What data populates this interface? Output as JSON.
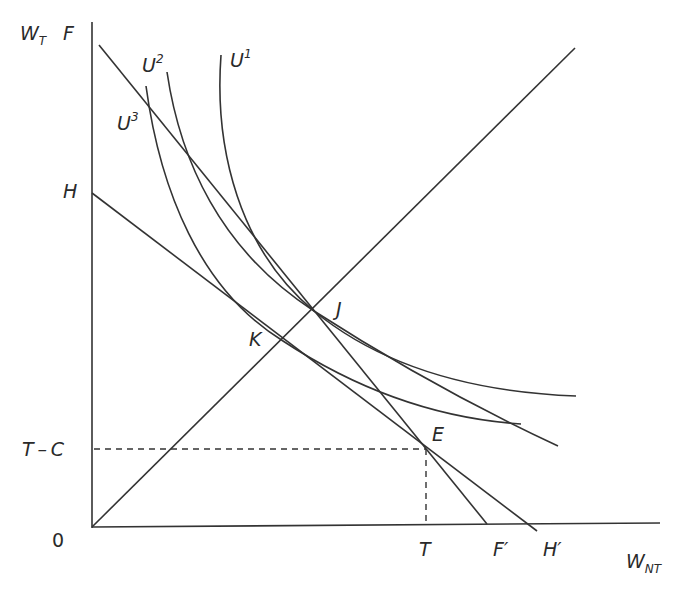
{
  "diagram": {
    "type": "indifference-curve diagram",
    "colors": {
      "stroke": "#333333",
      "text": "#2a2a2a",
      "background": "#ffffff"
    },
    "axes": {
      "y_label": {
        "main": "W",
        "sub": "T"
      },
      "x_label": {
        "main": "W",
        "sub": "NT"
      },
      "origin_label": "0"
    },
    "y_axis_labels": {
      "F": "F",
      "H": "H",
      "T_minus_C": "T – C"
    },
    "x_axis_labels": {
      "T": "T",
      "F_prime": "F′",
      "H_prime": "H′"
    },
    "curves": {
      "U1": {
        "main": "U",
        "sup": "1"
      },
      "U2": {
        "main": "U",
        "sup": "2"
      },
      "U3": {
        "main": "U",
        "sup": "3"
      }
    },
    "points": {
      "J": "J",
      "K": "K",
      "E": "E"
    },
    "lines": [
      {
        "name": "FF'",
        "from": "F",
        "to": "F'"
      },
      {
        "name": "HH'",
        "from": "H",
        "to": "H'"
      },
      {
        "name": "45-degree ray",
        "from": "0"
      }
    ],
    "guides": [
      {
        "name": "T-C horizontal dashed",
        "to": "E"
      },
      {
        "name": "T vertical dashed",
        "to": "E"
      }
    ]
  }
}
